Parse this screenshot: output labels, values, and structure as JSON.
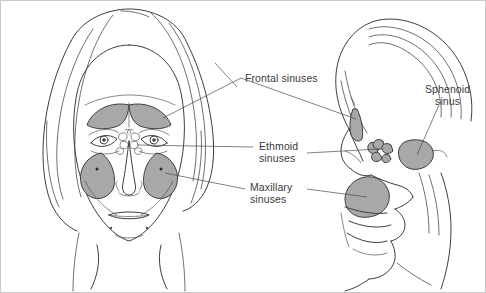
{
  "figure": {
    "background_color": "#ffffff",
    "border_color": "#c9c9c9",
    "line_color": "#3d3d3d",
    "sinus_fill_color": "#a8a8a8",
    "label_text_color": "#3a3a3a"
  },
  "views": {
    "frontal": {
      "name": "Frontal view of face"
    },
    "sagittal": {
      "name": "Sagittal profile view of head"
    }
  },
  "labels": [
    {
      "id": "frontal-sinuses",
      "text": "Frontal sinuses",
      "x": 244,
      "y": 72,
      "view": "frontal"
    },
    {
      "id": "ethmoid-sinuses",
      "text": "Ethmoid\nsinuses",
      "x": 258,
      "y": 140,
      "view": "frontal"
    },
    {
      "id": "maxillary-sinuses",
      "text": "Maxillary\nsinuses",
      "x": 249,
      "y": 181,
      "view": "frontal"
    },
    {
      "id": "sphenoid-sinus",
      "text": "Sphenoid\nsinus",
      "x": 424,
      "y": 83,
      "view": "sagittal"
    }
  ]
}
